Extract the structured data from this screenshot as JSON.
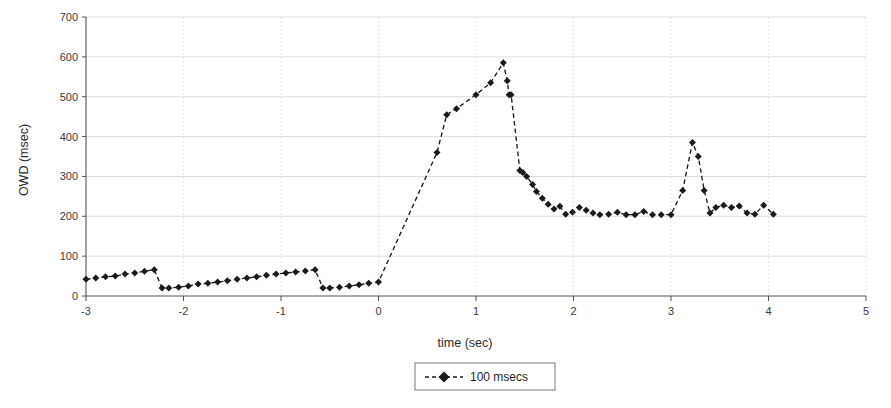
{
  "chart_data": {
    "type": "line",
    "title": "",
    "xlabel": "time (sec)",
    "ylabel": "OWD (msec)",
    "xlim": [
      -3,
      5
    ],
    "ylim": [
      0,
      700
    ],
    "xticks": [
      -3,
      -2,
      -1,
      0,
      1,
      2,
      3,
      4,
      5
    ],
    "xtick_labels": [
      "-3",
      "-2",
      "-1",
      "0",
      "1",
      "2",
      "3",
      "4",
      "5"
    ],
    "yticks": [
      0,
      100,
      200,
      300,
      400,
      500,
      600,
      700
    ],
    "ytick_labels": [
      "0",
      "100",
      "200",
      "300",
      "400",
      "500",
      "600",
      "700"
    ],
    "grid": true,
    "grid_color": "#d9d9d9",
    "legend_position": "below",
    "series": [
      {
        "name": "100 msecs",
        "color": "#1a1a1a",
        "linestyle": "dashed",
        "marker": "diamond",
        "x": [
          -3.0,
          -2.9,
          -2.8,
          -2.7,
          -2.6,
          -2.5,
          -2.4,
          -2.3,
          -2.22,
          -2.15,
          -2.05,
          -1.95,
          -1.85,
          -1.75,
          -1.65,
          -1.55,
          -1.45,
          -1.35,
          -1.25,
          -1.15,
          -1.05,
          -0.95,
          -0.85,
          -0.75,
          -0.65,
          -0.57,
          -0.5,
          -0.4,
          -0.3,
          -0.2,
          -0.1,
          0.0,
          0.6,
          0.7,
          0.8,
          1.0,
          1.15,
          1.28,
          1.32,
          1.34,
          1.36,
          1.45,
          1.48,
          1.52,
          1.58,
          1.62,
          1.68,
          1.74,
          1.8,
          1.86,
          1.92,
          1.99,
          2.06,
          2.13,
          2.2,
          2.27,
          2.36,
          2.45,
          2.54,
          2.63,
          2.72,
          2.81,
          2.9,
          3.0,
          3.12,
          3.22,
          3.28,
          3.34,
          3.4,
          3.46,
          3.54,
          3.62,
          3.7,
          3.78,
          3.86,
          3.95,
          4.05
        ],
        "y": [
          42,
          45,
          48,
          50,
          55,
          58,
          62,
          66,
          20,
          20,
          22,
          25,
          30,
          32,
          35,
          38,
          42,
          45,
          48,
          52,
          55,
          58,
          60,
          63,
          66,
          20,
          20,
          22,
          25,
          28,
          32,
          35,
          360,
          455,
          470,
          505,
          535,
          585,
          540,
          505,
          505,
          315,
          310,
          300,
          280,
          262,
          245,
          230,
          218,
          225,
          205,
          210,
          222,
          215,
          208,
          204,
          205,
          210,
          204,
          204,
          212,
          204,
          204,
          204,
          265,
          385,
          350,
          265,
          208,
          222,
          228,
          222,
          226,
          208,
          205,
          228,
          205
        ]
      }
    ]
  },
  "legend": {
    "entries": [
      {
        "label": "100 msecs"
      }
    ]
  },
  "axes": {
    "x_title": "time (sec)",
    "y_title": "OWD (msec)"
  }
}
